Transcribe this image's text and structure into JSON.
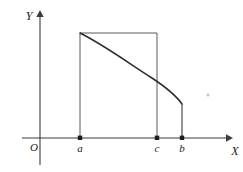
{
  "figure": {
    "colors": {
      "axis": "#3b3b3b",
      "curve": "#2a2a2a",
      "rectangle": "#5a5a5a",
      "label": "#222222",
      "background": "#ffffff"
    },
    "axes": {
      "x_label": "X",
      "y_label": "Y",
      "origin_label": "O"
    },
    "x_marks": [
      {
        "id": "a",
        "label": "a",
        "x": 80
      },
      {
        "id": "c",
        "label": "c",
        "x": 157
      },
      {
        "id": "b",
        "label": "b",
        "x": 182
      }
    ]
  },
  "chart_data": {
    "type": "line",
    "title": "",
    "xlabel": "X",
    "ylabel": "Y",
    "grid": false,
    "legend": null,
    "annotations": [
      {
        "text": "a",
        "x": 80,
        "y": 147
      },
      {
        "text": "c",
        "x": 156,
        "y": 147
      },
      {
        "text": "b",
        "x": 182,
        "y": 147
      },
      {
        "text": "O",
        "x": 34,
        "y": 147
      },
      {
        "text": "X",
        "x": 233,
        "y": 150
      },
      {
        "text": "Y",
        "x": 32,
        "y": 15
      }
    ],
    "series": [
      {
        "name": "curve",
        "kind": "curve",
        "path": "M 80 33 C 104 45, 130 64, 152 78 C 164 86, 175 94, 182 104",
        "points": [
          {
            "x": 80,
            "y": 33
          },
          {
            "x": 100,
            "y": 43
          },
          {
            "x": 120,
            "y": 56
          },
          {
            "x": 140,
            "y": 69
          },
          {
            "x": 157,
            "y": 81
          },
          {
            "x": 170,
            "y": 91
          },
          {
            "x": 182,
            "y": 104
          }
        ]
      },
      {
        "name": "rectangle",
        "kind": "polyline",
        "path": "M 80 33 L 157 33 L 157 138"
      },
      {
        "name": "left-vertical-at-a",
        "kind": "segment",
        "path": "M 80 33 L 80 138"
      },
      {
        "name": "drop-at-b",
        "kind": "segment",
        "path": "M 182 104 L 182 138"
      }
    ],
    "axis_geometry": {
      "x_axis": {
        "x1": 22,
        "y1": 138,
        "x2": 230,
        "y2": 138
      },
      "y_axis": {
        "x1": 40,
        "y1": 165,
        "x2": 40,
        "y2": 12
      }
    }
  }
}
